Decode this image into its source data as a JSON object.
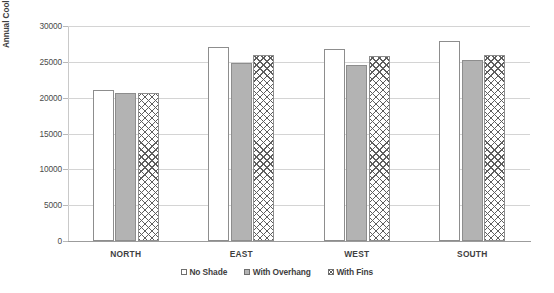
{
  "chart_data": {
    "type": "bar",
    "title": "",
    "xlabel": "",
    "ylabel": "Annual Cooling Energy (kWh)",
    "ylim": [
      0,
      30000
    ],
    "ytick_step": 5000,
    "yticks": [
      "0",
      "5000",
      "10000",
      "15000",
      "20000",
      "25000",
      "30000"
    ],
    "ytick_values": [
      0,
      5000,
      10000,
      15000,
      20000,
      25000,
      30000
    ],
    "grid": true,
    "legend_position": "bottom-center",
    "categories": [
      "NORTH",
      "EAST",
      "WEST",
      "SOUTH"
    ],
    "series": [
      {
        "name": "No Shade",
        "values": [
          21100,
          27100,
          26800,
          27900
        ],
        "fill": "white",
        "color": "#ffffff"
      },
      {
        "name": "With Overhang",
        "values": [
          20700,
          24800,
          24600,
          25200
        ],
        "fill": "solid-gray",
        "color": "#b3b3b3"
      },
      {
        "name": "With Fins",
        "values": [
          20600,
          26000,
          25800,
          26000
        ],
        "fill": "crosshatch",
        "color": "#5e5e5e"
      }
    ]
  }
}
